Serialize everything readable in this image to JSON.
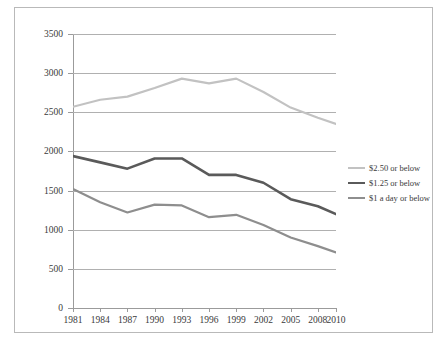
{
  "chart_data": {
    "type": "line",
    "title": "",
    "xlabel": "",
    "ylabel": "",
    "categories": [
      "1981",
      "1984",
      "1987",
      "1990",
      "1993",
      "1996",
      "1999",
      "2002",
      "2005",
      "2008",
      "2010"
    ],
    "x": [
      1981,
      1984,
      1987,
      1990,
      1993,
      1996,
      1999,
      2002,
      2005,
      2008,
      2010
    ],
    "xlim": [
      1981,
      2010
    ],
    "ylim": [
      0,
      3500
    ],
    "yticks": [
      0,
      500,
      1000,
      1500,
      2000,
      2500,
      3000,
      3500
    ],
    "ytick_labels": [
      "0",
      "500",
      "1000",
      "1500",
      "2000",
      "2500",
      "3000",
      "3500"
    ],
    "grid": "horizontal",
    "legend_position": "right",
    "series": [
      {
        "name": "$2.50 or below",
        "color": "#c2c2c2",
        "width": 2.2,
        "values": [
          2570,
          2660,
          2700,
          2810,
          2930,
          2870,
          2930,
          2760,
          2560,
          2430,
          2350
        ]
      },
      {
        "name": "$1.25 or below",
        "color": "#5a5a5a",
        "width": 2.6,
        "values": [
          1940,
          1860,
          1780,
          1910,
          1910,
          1700,
          1700,
          1600,
          1390,
          1300,
          1200
        ]
      },
      {
        "name": "$1 a day or below",
        "color": "#8e8e8e",
        "width": 2.2,
        "values": [
          1520,
          1350,
          1220,
          1320,
          1310,
          1160,
          1190,
          1060,
          900,
          790,
          710
        ]
      }
    ]
  },
  "legend": {
    "items": [
      {
        "label": "$2.50 or below",
        "color": "#c2c2c2",
        "width": 2.2
      },
      {
        "label": "$1.25 or below",
        "color": "#5a5a5a",
        "width": 2.6
      },
      {
        "label": "$1 a day or below",
        "color": "#8e8e8e",
        "width": 2.2
      }
    ]
  }
}
